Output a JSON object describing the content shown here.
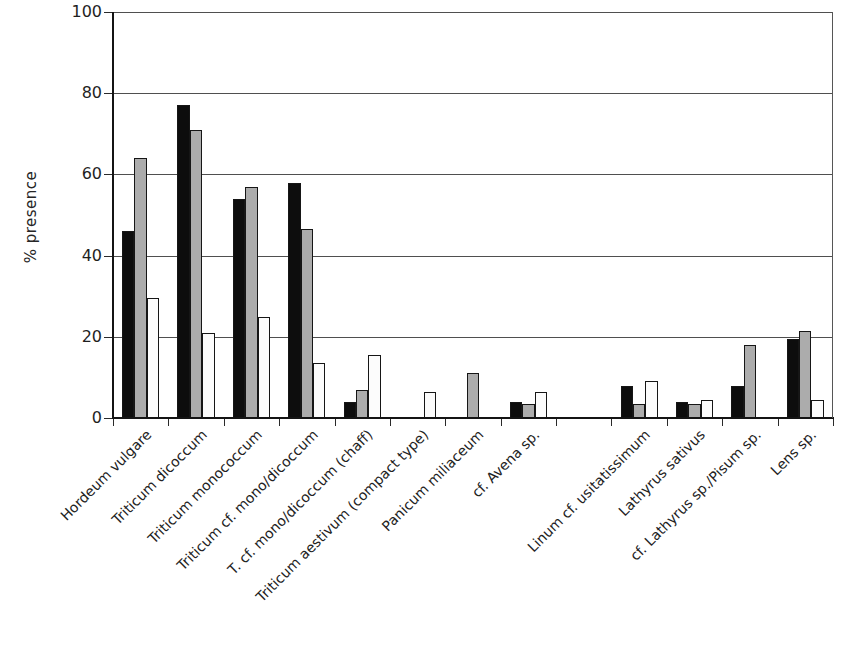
{
  "chart_data": {
    "type": "bar",
    "title": "",
    "xlabel": "",
    "ylabel": "% presence",
    "ylim": [
      0,
      100
    ],
    "yticks": [
      0,
      20,
      40,
      60,
      80,
      100
    ],
    "grid": true,
    "legend": "none",
    "categories": [
      "Hordeum vulgare",
      "Triticum dicoccum",
      "Triticum monococcum",
      "Triticum cf. mono/dicoccum",
      "T. cf. mono/dicoccum (chaff)",
      "Triticum aestivum (compact type)",
      "Panicum miliaceum",
      "cf. Avena sp.",
      "",
      "Linum cf. usitatissimum",
      "Lathyrus sativus",
      "cf. Lathyrus sp./Pisum sp.",
      "Lens sp."
    ],
    "series": [
      {
        "name": "black",
        "color": "#0d0d0d",
        "values": [
          46,
          77,
          54,
          58,
          4,
          0,
          0,
          4,
          0,
          8,
          4,
          8,
          19.5
        ]
      },
      {
        "name": "grey",
        "color": "#acacac",
        "values": [
          64,
          71,
          57,
          46.5,
          7,
          0,
          11,
          3.5,
          0,
          3.5,
          3.5,
          18,
          21.5
        ]
      },
      {
        "name": "white",
        "color": "#fcfcfc",
        "values": [
          29.5,
          21,
          25,
          13.5,
          15.5,
          6.5,
          0,
          6.5,
          0,
          9,
          4.5,
          0,
          4.5
        ]
      }
    ],
    "colors": {
      "outline": "#161616",
      "gridline": "#4f4f4f",
      "axis": "#141414",
      "text": "#1f1f1f",
      "background": "#ffffff"
    },
    "layout": {
      "plot_left": 113,
      "plot_top": 12,
      "plot_width": 720,
      "plot_height": 406
    }
  }
}
